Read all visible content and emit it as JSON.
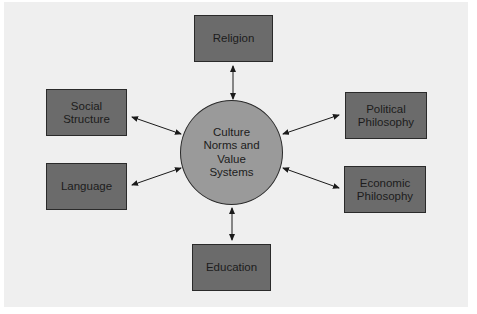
{
  "diagram": {
    "center": {
      "label": "Culture\nNorms and\nValue\nSystems"
    },
    "nodes": [
      {
        "id": "religion",
        "label": "Religion"
      },
      {
        "id": "social-structure",
        "label": "Social\nStructure"
      },
      {
        "id": "political-philosophy",
        "label": "Political\nPhilosophy"
      },
      {
        "id": "language",
        "label": "Language"
      },
      {
        "id": "economic-philosophy",
        "label": "Economic\nPhilosophy"
      },
      {
        "id": "education",
        "label": "Education"
      }
    ],
    "edges": [
      {
        "from": "center",
        "to": "religion",
        "type": "bidirectional"
      },
      {
        "from": "center",
        "to": "social-structure",
        "type": "bidirectional"
      },
      {
        "from": "center",
        "to": "political-philosophy",
        "type": "bidirectional"
      },
      {
        "from": "center",
        "to": "language",
        "type": "bidirectional"
      },
      {
        "from": "center",
        "to": "economic-philosophy",
        "type": "bidirectional"
      },
      {
        "from": "center",
        "to": "education",
        "type": "bidirectional"
      }
    ],
    "colors": {
      "background": "#efefef",
      "box_fill": "#6b6b6b",
      "circle_fill": "#9a9a9a",
      "stroke": "#2a2a2a"
    }
  }
}
